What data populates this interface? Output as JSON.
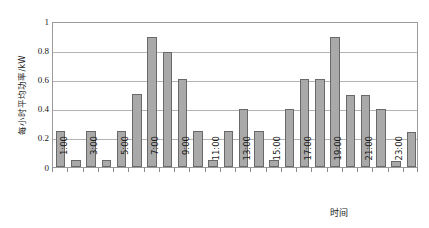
{
  "chart_data": {
    "type": "bar",
    "title": "",
    "subtitle": "",
    "xlabel": "时间",
    "ylabel": "每小时平均功率/kW",
    "ylim": [
      0,
      1
    ],
    "y_ticks": [
      "0",
      "0.2",
      "0.4",
      "0.6",
      "0.8",
      "1"
    ],
    "y_tick_values": [
      0,
      0.2,
      0.4,
      0.6,
      0.8,
      1
    ],
    "grid": "horizontal",
    "legend": "none",
    "categories": [
      "1:00",
      "2:00",
      "3:00",
      "4:00",
      "5:00",
      "6:00",
      "7:00",
      "8:00",
      "9:00",
      "10:00",
      "11:00",
      "12:00",
      "13:00",
      "14:00",
      "15:00",
      "16:00",
      "17:00",
      "18:00",
      "19:00",
      "20:00",
      "21:00",
      "22:00",
      "23:00",
      "24:00"
    ],
    "x_tick_labels": [
      "1:00",
      "3:00",
      "5:00",
      "7:00",
      "9:00",
      "11:00",
      "13:00",
      "15:00",
      "17:00",
      "19:00",
      "21:00",
      "23:00"
    ],
    "x_tick_label_indices": [
      0,
      2,
      4,
      6,
      8,
      10,
      12,
      14,
      16,
      18,
      20,
      22
    ],
    "values": [
      0.25,
      0.05,
      0.25,
      0.05,
      0.25,
      0.5,
      0.89,
      0.79,
      0.6,
      0.25,
      0.05,
      0.25,
      0.4,
      0.25,
      0.05,
      0.4,
      0.6,
      0.6,
      0.89,
      0.49,
      0.49,
      0.4,
      0.04,
      0.24
    ],
    "series_name": "每小时平均功率",
    "colors": {
      "bar_fill": "#a9a9a9",
      "bar_border": "#696969",
      "gridline": "#b4b4b4",
      "axis": "#9a9a9a",
      "text": "#1a1a1a",
      "background": "#ffffff"
    }
  }
}
